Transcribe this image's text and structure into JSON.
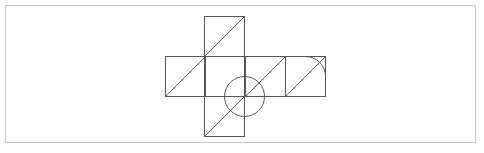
{
  "page": {
    "width": 484,
    "height": 153,
    "background_color": "#ffffff"
  },
  "border": {
    "name": "outer-page-border",
    "x": 5.5,
    "y": 5.5,
    "width": 470,
    "height": 137,
    "stroke_color": "#c8c8c8",
    "stroke_width": 1,
    "fill": "none"
  },
  "figure": {
    "stroke_color": "#55555a",
    "stroke_width": 1,
    "fill": "none",
    "cell_size": 40,
    "grid_origin": {
      "x": 165,
      "y": 56
    },
    "squares": [
      {
        "name": "band-square-1",
        "x": 165,
        "y": 56,
        "w": 40,
        "h": 40
      },
      {
        "name": "band-square-2",
        "x": 205,
        "y": 56,
        "w": 40,
        "h": 40
      },
      {
        "name": "band-square-3",
        "x": 245,
        "y": 56,
        "w": 40,
        "h": 40
      },
      {
        "name": "band-square-4",
        "x": 285,
        "y": 56,
        "w": 40,
        "h": 40
      },
      {
        "name": "top-square",
        "x": 204,
        "y": 16,
        "w": 40,
        "h": 40
      },
      {
        "name": "bottom-square",
        "x": 204,
        "y": 96,
        "w": 40,
        "h": 40
      }
    ],
    "band_outline": {
      "x": 165,
      "y": 56,
      "w": 160,
      "h": 40
    },
    "column_outline": {
      "x": 204,
      "y": 16,
      "w": 40,
      "h": 120
    },
    "internal_dividers": [
      {
        "name": "divider-v-1",
        "x1": 205,
        "y1": 56,
        "x2": 205,
        "y2": 96
      },
      {
        "name": "divider-v-2",
        "x1": 245,
        "y1": 56,
        "x2": 245,
        "y2": 96
      },
      {
        "name": "divider-v-3",
        "x1": 285,
        "y1": 56,
        "x2": 285,
        "y2": 96
      },
      {
        "name": "divider-h-top",
        "x1": 204,
        "y1": 56,
        "x2": 244,
        "y2": 56
      },
      {
        "name": "divider-h-bottom",
        "x1": 204,
        "y1": 96,
        "x2": 244,
        "y2": 96
      }
    ],
    "diagonals": [
      {
        "name": "diagonal-band-square-1",
        "x1": 165,
        "y1": 96,
        "x2": 205,
        "y2": 56
      },
      {
        "name": "diagonal-top-square",
        "x1": 204,
        "y1": 56,
        "x2": 244,
        "y2": 16
      },
      {
        "name": "diagonal-band-square-3",
        "x1": 245,
        "y1": 96,
        "x2": 285,
        "y2": 56
      },
      {
        "name": "diagonal-band-square-4",
        "x1": 285,
        "y1": 96,
        "x2": 325,
        "y2": 56
      },
      {
        "name": "diagonal-bottom-square",
        "x1": 204,
        "y1": 136,
        "x2": 244,
        "y2": 96
      }
    ],
    "circle": {
      "name": "center-circle",
      "cx": 244,
      "cy": 96,
      "r": 20
    },
    "quarter_arc": {
      "name": "corner-quarter-arc",
      "center_x": 325,
      "center_y": 56,
      "radius": 20,
      "start_x": 305,
      "start_y": 56,
      "end_x": 325,
      "end_y": 76
    }
  }
}
